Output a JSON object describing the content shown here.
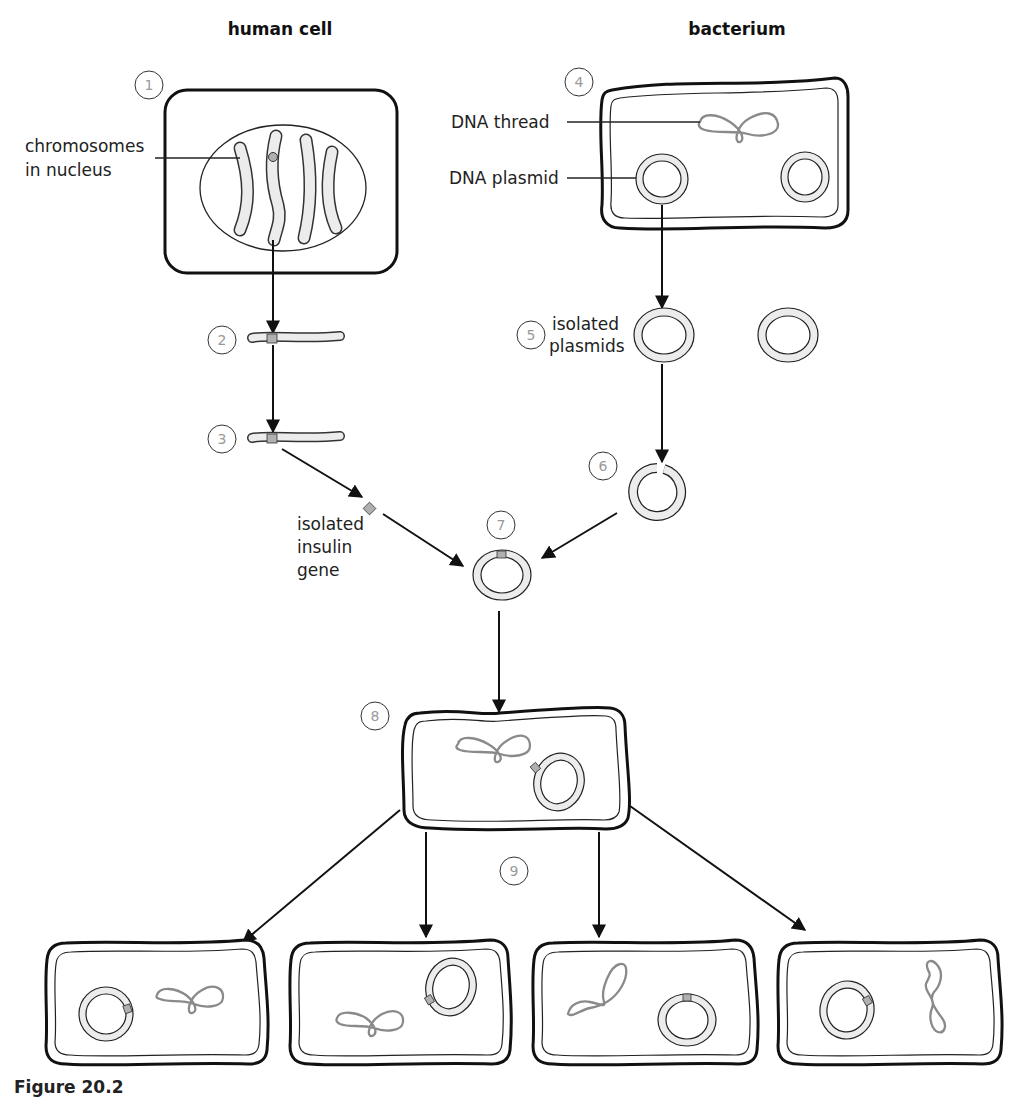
{
  "headings": {
    "human_cell": "human cell",
    "bacterium": "bacterium"
  },
  "labels": {
    "chromosomes_line1": "chromosomes",
    "chromosomes_line2": "in nucleus",
    "dna_thread": "DNA thread",
    "dna_plasmid": "DNA plasmid",
    "isolated_plasmids_line1": "isolated",
    "isolated_plasmids_line2": "plasmids",
    "insulin_line1": "isolated",
    "insulin_line2": "insulin",
    "insulin_line3": "gene"
  },
  "steps": [
    "1",
    "2",
    "3",
    "4",
    "5",
    "6",
    "7",
    "8",
    "9"
  ],
  "caption": "Figure 20.2",
  "colors": {
    "outline": "#111111",
    "dna_thread": "#8a8a8a",
    "fill_light": "#ececec",
    "gene_marker": "#b0b0b0",
    "step_number": "#999999"
  }
}
